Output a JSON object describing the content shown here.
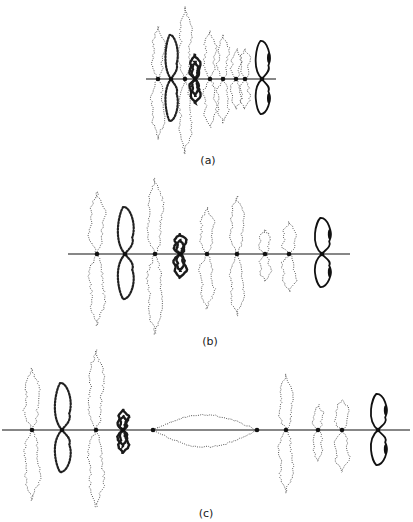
{
  "figure": {
    "panels": [
      {
        "id": "a",
        "label": "(a)",
        "axis": {
          "y": 79,
          "x1": 146,
          "x2": 276
        },
        "label_pos": {
          "x": 208,
          "y": 154
        },
        "loops": [
          {
            "x": 158,
            "up": 52,
            "down": 60,
            "w": 9,
            "style": "dotted"
          },
          {
            "x": 171,
            "up": 44,
            "down": 42,
            "w": 7,
            "style": "beaded"
          },
          {
            "x": 185,
            "up": 72,
            "down": 75,
            "w": 9,
            "style": "dotted"
          },
          {
            "x": 195,
            "up": 24,
            "down": 24,
            "w": 8,
            "style": "dense"
          },
          {
            "x": 210,
            "up": 48,
            "down": 48,
            "w": 9,
            "style": "dotted"
          },
          {
            "x": 223,
            "up": 44,
            "down": 44,
            "w": 8,
            "style": "dotted"
          },
          {
            "x": 236,
            "up": 30,
            "down": 30,
            "w": 7,
            "style": "dotted"
          },
          {
            "x": 245,
            "up": 30,
            "down": 30,
            "w": 7,
            "style": "dotted"
          },
          {
            "x": 262,
            "up": 38,
            "down": 35,
            "w": 8,
            "style": "solid"
          }
        ]
      },
      {
        "id": "b",
        "label": "(b)",
        "axis": {
          "y": 254,
          "x1": 68,
          "x2": 350
        },
        "label_pos": {
          "x": 210,
          "y": 335
        },
        "loops": [
          {
            "x": 97,
            "up": 62,
            "down": 72,
            "w": 11,
            "style": "dotted"
          },
          {
            "x": 125,
            "up": 47,
            "down": 45,
            "w": 9,
            "style": "beaded"
          },
          {
            "x": 155,
            "up": 76,
            "down": 80,
            "w": 11,
            "style": "dotted"
          },
          {
            "x": 180,
            "up": 20,
            "down": 24,
            "w": 9,
            "style": "dense"
          },
          {
            "x": 207,
            "up": 46,
            "down": 55,
            "w": 10,
            "style": "dotted"
          },
          {
            "x": 237,
            "up": 58,
            "down": 62,
            "w": 10,
            "style": "dotted"
          },
          {
            "x": 265,
            "up": 24,
            "down": 27,
            "w": 8,
            "style": "dotted"
          },
          {
            "x": 289,
            "up": 32,
            "down": 38,
            "w": 10,
            "style": "dotted"
          },
          {
            "x": 322,
            "up": 36,
            "down": 33,
            "w": 9,
            "style": "solid"
          }
        ]
      },
      {
        "id": "c",
        "label": "(c)",
        "axis": {
          "y": 430,
          "x1": 2,
          "x2": 410
        },
        "label_pos": {
          "x": 206,
          "y": 507
        },
        "loops": [
          {
            "x": 32,
            "up": 62,
            "down": 70,
            "w": 11,
            "style": "dotted"
          },
          {
            "x": 62,
            "up": 47,
            "down": 42,
            "w": 9,
            "style": "beaded"
          },
          {
            "x": 96,
            "up": 80,
            "down": 77,
            "w": 11,
            "style": "dotted"
          },
          {
            "x": 123,
            "up": 20,
            "down": 23,
            "w": 8,
            "style": "dense"
          },
          {
            "x": 286,
            "up": 56,
            "down": 63,
            "w": 10,
            "style": "dotted"
          },
          {
            "x": 318,
            "up": 25,
            "down": 31,
            "w": 7,
            "style": "dotted"
          },
          {
            "x": 342,
            "up": 30,
            "down": 42,
            "w": 10,
            "style": "dotted"
          },
          {
            "x": 378,
            "up": 36,
            "down": 35,
            "w": 9,
            "style": "solid"
          }
        ],
        "horizontal_loop": {
          "x1": 153,
          "x2": 257,
          "y": 430,
          "up": 15,
          "down": 17
        }
      }
    ]
  }
}
